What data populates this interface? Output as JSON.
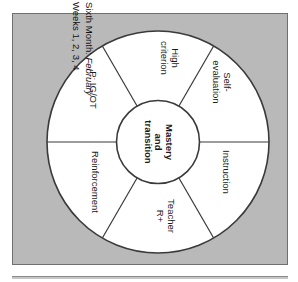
{
  "figure": {
    "kind": "wheel-diagram",
    "colors": {
      "panel_background": "#b9b9b9",
      "wheel_fill": "#ffffff",
      "stroke": "#3a3a3a",
      "text": "#1a1a1a"
    }
  },
  "side_caption": {
    "line1_prefix": "Sixth Month: ",
    "line1_emphasis": "February",
    "line2": "Weeks 1, 2, 3, 4"
  },
  "hub": {
    "label": "Mastery\nand\ntransition"
  },
  "segments": [
    {
      "id": "high-criterion",
      "label": "High\ncriterion"
    },
    {
      "id": "self-evaluation",
      "label": "Self-\nevaluation"
    },
    {
      "id": "instruction",
      "label": "Instruction"
    },
    {
      "id": "teacher-r",
      "label": "Teacher\nR+"
    },
    {
      "id": "reinforcement",
      "label": "Reinforcement"
    },
    {
      "id": "p-ig-ot",
      "label": "P: IG/OT"
    }
  ]
}
